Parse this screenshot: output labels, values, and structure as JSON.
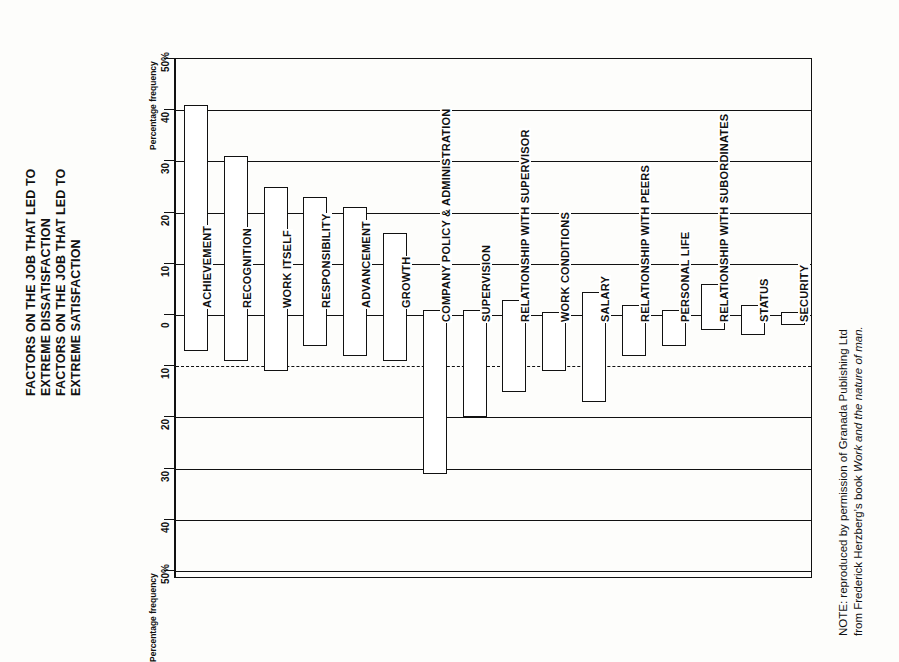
{
  "titles": {
    "dissatisfaction": [
      "FACTORS ON THE JOB THAT LED TO",
      "EXTREME DISSATISFACTION"
    ],
    "satisfaction": [
      "FACTORS ON THE JOB THAT LED TO",
      "EXTREME SATISFACTION"
    ]
  },
  "axis": {
    "caption_top": "Percentage frequency",
    "caption_bottom": "Percentage frequency",
    "ticks_top": [
      "50%",
      "40",
      "30",
      "20",
      "10",
      "0"
    ],
    "ticks_bottom": [
      "10",
      "20",
      "30",
      "40",
      "50%"
    ]
  },
  "note": {
    "line1": "NOTE: reproduced by permission of Granada Publishing Ltd",
    "line2_prefix": "from Frederick Herzberg’s book ",
    "line2_italic": "Work and the nature of man."
  },
  "chart_data": {
    "type": "bar",
    "orientation": "vertical-bars-rotated-90ccw",
    "xlabel": "",
    "ylabel": "Percentage frequency",
    "ylim": [
      -50,
      50
    ],
    "yticks": [
      -50,
      -40,
      -30,
      -20,
      -10,
      0,
      10,
      20,
      30,
      40,
      50
    ],
    "grid": true,
    "legend": "none",
    "series": [
      {
        "name": "Percentage frequency of satisfaction (above zero)"
      },
      {
        "name": "Percentage frequency of dissatisfaction (below zero)"
      }
    ],
    "categories": [
      "ACHIEVEMENT",
      "RECOGNITION",
      "WORK ITSELF",
      "RESPONSIBILITY",
      "ADVANCEMENT",
      "GROWTH",
      "COMPANY POLICY & ADMINISTRATION",
      "SUPERVISION",
      "RELATIONSHIP WITH SUPERVISOR",
      "WORK CONDITIONS",
      "SALARY",
      "RELATIONSHIP WITH PEERS",
      "PERSONAL LIFE",
      "RELATIONSHIP WITH SUBORDINATES",
      "STATUS",
      "SECURITY"
    ],
    "satisfaction_values": [
      41,
      31,
      25,
      23,
      21,
      16,
      1,
      1,
      3,
      0.5,
      4.5,
      2,
      1,
      6,
      2,
      0.5
    ],
    "dissatisfaction_values": [
      7,
      9,
      11,
      6,
      8,
      9,
      31,
      20,
      15,
      11,
      17,
      8,
      6,
      3,
      4,
      2
    ],
    "bars": [
      {
        "label": "ACHIEVEMENT",
        "satisfaction": 41,
        "dissatisfaction": 7,
        "group": "motivator"
      },
      {
        "label": "RECOGNITION",
        "satisfaction": 31,
        "dissatisfaction": 9,
        "group": "motivator"
      },
      {
        "label": "WORK ITSELF",
        "satisfaction": 25,
        "dissatisfaction": 11,
        "group": "motivator"
      },
      {
        "label": "RESPONSIBILITY",
        "satisfaction": 23,
        "dissatisfaction": 6,
        "group": "motivator"
      },
      {
        "label": "ADVANCEMENT",
        "satisfaction": 21,
        "dissatisfaction": 8,
        "group": "motivator"
      },
      {
        "label": "GROWTH",
        "satisfaction": 16,
        "dissatisfaction": 9,
        "group": "motivator"
      },
      {
        "label": "COMPANY POLICY & ADMINISTRATION",
        "satisfaction": 1,
        "dissatisfaction": 31,
        "group": "hygiene"
      },
      {
        "label": "SUPERVISION",
        "satisfaction": 1,
        "dissatisfaction": 20,
        "group": "hygiene"
      },
      {
        "label": "RELATIONSHIP WITH SUPERVISOR",
        "satisfaction": 3,
        "dissatisfaction": 15,
        "group": "hygiene"
      },
      {
        "label": "WORK CONDITIONS",
        "satisfaction": 0.5,
        "dissatisfaction": 11,
        "group": "hygiene"
      },
      {
        "label": "SALARY",
        "satisfaction": 4.5,
        "dissatisfaction": 17,
        "group": "hygiene"
      },
      {
        "label": "RELATIONSHIP WITH PEERS",
        "satisfaction": 2,
        "dissatisfaction": 8,
        "group": "hygiene"
      },
      {
        "label": "PERSONAL LIFE",
        "satisfaction": 1,
        "dissatisfaction": 6,
        "group": "hygiene"
      },
      {
        "label": "RELATIONSHIP WITH SUBORDINATES",
        "satisfaction": 6,
        "dissatisfaction": 3,
        "group": "hygiene"
      },
      {
        "label": "STATUS",
        "satisfaction": 2,
        "dissatisfaction": 4,
        "group": "hygiene"
      },
      {
        "label": "SECURITY",
        "satisfaction": 0.5,
        "dissatisfaction": 2,
        "group": "hygiene"
      }
    ]
  }
}
